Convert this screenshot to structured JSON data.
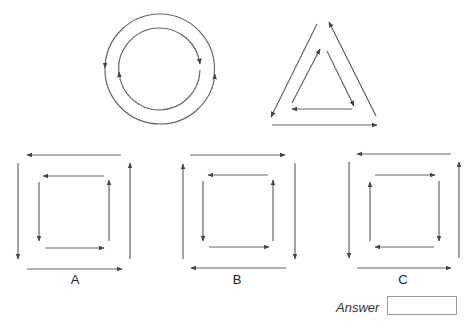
{
  "puzzle": {
    "stroke_color": "#555555",
    "examples": [
      {
        "name": "circle",
        "outer": {
          "shape": "circle",
          "direction": "clockwise"
        },
        "inner": {
          "shape": "circle",
          "direction": "counterclockwise"
        }
      },
      {
        "name": "triangle",
        "outer": {
          "shape": "triangle",
          "direction": "clockwise"
        },
        "inner": {
          "shape": "triangle",
          "direction": "counterclockwise"
        }
      }
    ],
    "options": [
      {
        "label": "A",
        "outer_direction": "counterclockwise",
        "inner_direction": "counterclockwise"
      },
      {
        "label": "B",
        "outer_direction": "clockwise",
        "inner_direction": "counterclockwise"
      },
      {
        "label": "C",
        "outer_direction": "counterclockwise",
        "inner_direction": "clockwise"
      }
    ]
  },
  "answer": {
    "label": "Answer",
    "value": ""
  }
}
